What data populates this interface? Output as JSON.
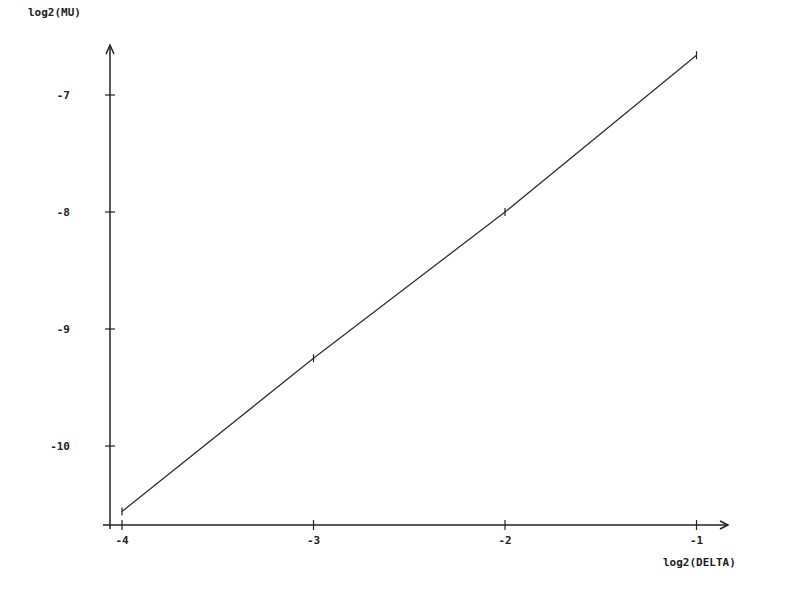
{
  "chart_data": {
    "type": "line",
    "title": "",
    "xlabel": "log2(DELTA)",
    "ylabel": "log2(MU)",
    "x": [
      -4,
      -3,
      -2,
      -1
    ],
    "series": [
      {
        "name": "log2(MU) vs log2(DELTA)",
        "values": [
          -10.56,
          -9.25,
          -8.0,
          -6.66
        ]
      }
    ],
    "xlim": [
      -4.06,
      -0.84
    ],
    "ylim": [
      -10.7,
      -6.5
    ],
    "xticks": [
      -4,
      -3,
      -2,
      -1
    ],
    "yticks": [
      -10,
      -9,
      -8,
      -7
    ],
    "grid": false,
    "legend": "none",
    "colors": {
      "line": "#333333",
      "axis": "#222222",
      "background": "#ffffff"
    }
  },
  "axes": {
    "xlabel": "log2(DELTA)",
    "ylabel": "log2(MU)",
    "xtick_labels": [
      "-4",
      "-3",
      "-2",
      "-1"
    ],
    "ytick_labels": [
      "-10",
      "-9",
      "-8",
      "-7"
    ]
  }
}
